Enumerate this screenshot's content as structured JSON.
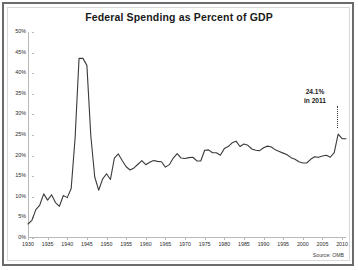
{
  "chart_data": {
    "type": "line",
    "title": "Federal Spending as Percent of GDP",
    "xlabel": "",
    "ylabel": "",
    "xlim": [
      1930,
      2011
    ],
    "ylim": [
      0,
      50
    ],
    "grid": false,
    "legend": "none",
    "source": "Source: OMB",
    "y_ticks": [
      "0%",
      "5%",
      "10%",
      "15%",
      "20%",
      "25%",
      "30%",
      "35%",
      "40%",
      "45%",
      "50%"
    ],
    "y_tick_values": [
      0,
      5,
      10,
      15,
      20,
      25,
      30,
      35,
      40,
      45,
      50
    ],
    "x_ticks": [
      "1930",
      "1935",
      "1940",
      "1945",
      "1950",
      "1955",
      "1960",
      "1965",
      "1970",
      "1975",
      "1980",
      "1985",
      "1990",
      "1995",
      "2000",
      "2005",
      "2010"
    ],
    "x_tick_values": [
      1930,
      1935,
      1940,
      1945,
      1950,
      1955,
      1960,
      1965,
      1970,
      1975,
      1980,
      1985,
      1990,
      1995,
      2000,
      2005,
      2010
    ],
    "line_color": "#3a3a3a",
    "annotations": [
      {
        "label_line1": "24.1%",
        "label_line2": "in 2011",
        "x": 2011,
        "y": 24.1
      }
    ],
    "series": [
      {
        "name": "Federal Spending (% of GDP)",
        "x": [
          1930,
          1931,
          1932,
          1933,
          1934,
          1935,
          1936,
          1937,
          1938,
          1939,
          1940,
          1941,
          1942,
          1943,
          1944,
          1945,
          1946,
          1947,
          1948,
          1949,
          1950,
          1951,
          1952,
          1953,
          1954,
          1955,
          1956,
          1957,
          1958,
          1959,
          1960,
          1961,
          1962,
          1963,
          1964,
          1965,
          1966,
          1967,
          1968,
          1969,
          1970,
          1971,
          1972,
          1973,
          1974,
          1975,
          1976,
          1977,
          1978,
          1979,
          1980,
          1981,
          1982,
          1983,
          1984,
          1985,
          1986,
          1987,
          1988,
          1989,
          1990,
          1991,
          1992,
          1993,
          1994,
          1995,
          1996,
          1997,
          1998,
          1999,
          2000,
          2001,
          2002,
          2003,
          2004,
          2005,
          2006,
          2007,
          2008,
          2009,
          2010,
          2011
        ],
        "y": [
          3.4,
          4.3,
          6.9,
          8.0,
          10.7,
          9.2,
          10.5,
          8.6,
          7.7,
          10.3,
          9.8,
          12.0,
          24.3,
          43.6,
          43.6,
          41.9,
          24.8,
          14.8,
          11.6,
          14.3,
          15.6,
          14.2,
          19.4,
          20.4,
          18.8,
          17.3,
          16.5,
          17.0,
          17.9,
          18.8,
          17.8,
          18.4,
          18.8,
          18.6,
          18.5,
          17.2,
          17.8,
          19.4,
          20.5,
          19.4,
          19.3,
          19.5,
          19.6,
          18.7,
          18.7,
          21.3,
          21.4,
          20.7,
          20.7,
          20.1,
          21.7,
          22.2,
          23.1,
          23.5,
          22.2,
          22.8,
          22.5,
          21.6,
          21.3,
          21.2,
          21.9,
          22.3,
          22.1,
          21.4,
          21.0,
          20.6,
          20.2,
          19.5,
          19.1,
          18.5,
          18.2,
          18.2,
          19.1,
          19.7,
          19.6,
          19.9,
          20.1,
          19.6,
          20.7,
          25.2,
          24.1,
          24.1
        ]
      }
    ]
  }
}
